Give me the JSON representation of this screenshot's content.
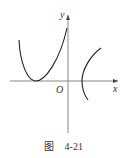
{
  "figure": {
    "axis_labels": {
      "x": "x",
      "y": "y",
      "origin": "O"
    },
    "caption": {
      "prefix": "图",
      "number": "4-21"
    },
    "curves": [
      {
        "name": "left-curve",
        "description": "U-shaped curve left of y-axis, tangent to x-axis at its minimum"
      },
      {
        "name": "right-curve",
        "description": "arc right of y-axis opening right, crossing x-axis"
      }
    ],
    "colors": {
      "curve": "#222222",
      "axis": "#888888",
      "text": "#333333"
    }
  }
}
